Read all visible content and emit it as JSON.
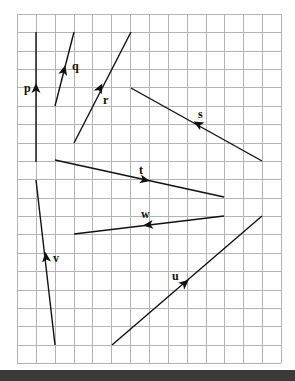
{
  "diagram": {
    "type": "vector-grid",
    "grid": {
      "origin_px": [
        17,
        14
      ],
      "columns": 14,
      "rows": 19,
      "cell_w_px": 18.86,
      "cell_h_px": 18.37,
      "line_color": "#b4b4b4"
    },
    "vectors": [
      {
        "id": "p",
        "label": "p",
        "from": [
          36,
          162
        ],
        "to": [
          36,
          32
        ],
        "arrow_at": [
          36,
          88
        ],
        "label_pos": [
          24,
          92
        ]
      },
      {
        "id": "q",
        "label": "q",
        "from": [
          55,
          106
        ],
        "to": [
          74,
          32
        ],
        "arrow_at": [
          64,
          70
        ],
        "label_pos": [
          72,
          70
        ]
      },
      {
        "id": "r",
        "label": "r",
        "from": [
          74,
          143
        ],
        "to": [
          131,
          32
        ],
        "arrow_at": [
          100,
          88
        ],
        "label_pos": [
          103,
          104
        ]
      },
      {
        "id": "s",
        "label": "s",
        "from": [
          262,
          161
        ],
        "to": [
          131,
          88
        ],
        "arrow_at": [
          198,
          124
        ],
        "label_pos": [
          198,
          118
        ]
      },
      {
        "id": "t",
        "label": "t",
        "from": [
          55,
          160
        ],
        "to": [
          224,
          197
        ],
        "arrow_at": [
          145,
          180
        ],
        "label_pos": [
          139,
          174
        ]
      },
      {
        "id": "u",
        "label": "u",
        "from": [
          112,
          345
        ],
        "to": [
          262,
          216
        ],
        "arrow_at": [
          185,
          283
        ],
        "label_pos": [
          172,
          280
        ]
      },
      {
        "id": "v",
        "label": "v",
        "from": [
          55,
          345
        ],
        "to": [
          36,
          180
        ],
        "arrow_at": [
          46,
          257
        ],
        "label_pos": [
          53,
          262
        ]
      },
      {
        "id": "w",
        "label": "w",
        "from": [
          224,
          216
        ],
        "to": [
          74,
          234
        ],
        "arrow_at": [
          148,
          225
        ],
        "label_pos": [
          141,
          218
        ]
      }
    ],
    "line_color": "#111111",
    "bottom_bar_color": "#3a3a3a"
  }
}
